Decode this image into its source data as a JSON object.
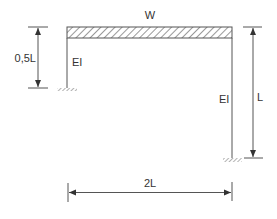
{
  "diagram": {
    "type": "portal-frame",
    "beam": {
      "load_label": "W",
      "load_type": "uniformly distributed load"
    },
    "left_column": {
      "stiffness_label": "EI",
      "height_label": "0,5L",
      "support": "fixed"
    },
    "right_column": {
      "stiffness_label": "EI",
      "height_label": "L",
      "support": "fixed"
    },
    "span": {
      "label": "2L"
    },
    "colors": {
      "line": "#555555",
      "hatch": "#444444",
      "text": "#333333"
    }
  }
}
